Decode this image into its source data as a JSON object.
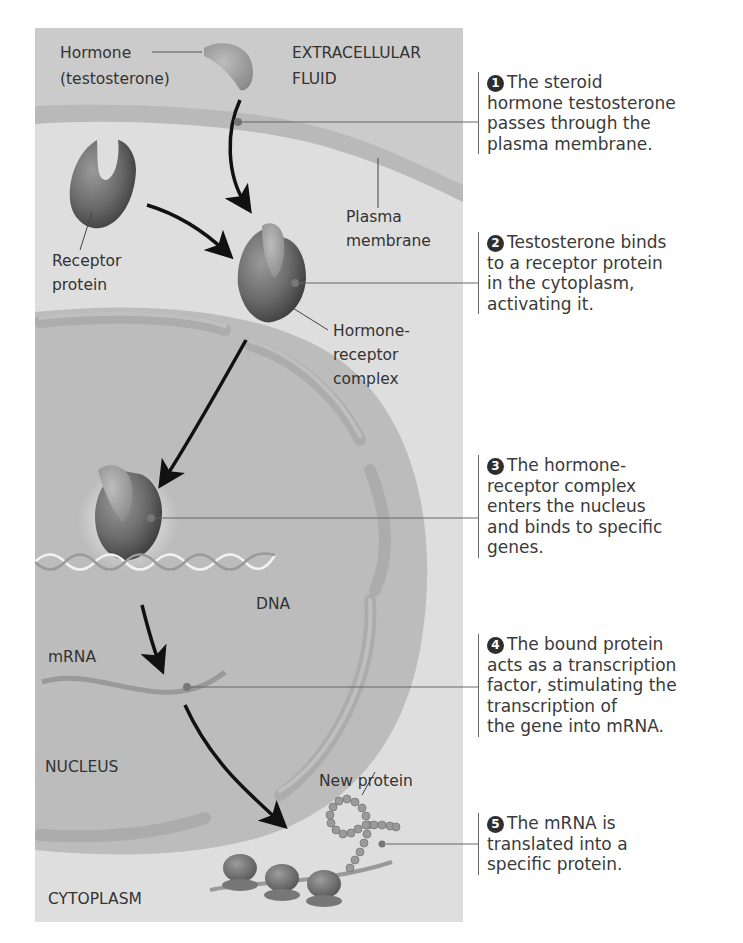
{
  "diagram": {
    "colors": {
      "extracellular": "#c9c9c9",
      "cytoplasm": "#dedede",
      "membrane": "#b8b8b8",
      "nucleus": "#bdbdbd",
      "nuclear_envelope": "#b0b0b0",
      "protein": "#6a6a6a",
      "hormone": "#9a9a9a",
      "arrow": "#111111",
      "leader_line": "#666666"
    },
    "labels": {
      "hormone": "Hormone",
      "hormone_sub": "(testosterone)",
      "extracellular_1": "EXTRACELLULAR",
      "extracellular_2": "FLUID",
      "plasma_1": "Plasma",
      "plasma_2": "membrane",
      "receptor_1": "Receptor",
      "receptor_2": "protein",
      "complex_1": "Hormone-",
      "complex_2": "receptor",
      "complex_3": "complex",
      "dna": "DNA",
      "mrna": "mRNA",
      "nucleus": "NUCLEUS",
      "new_protein": "New protein",
      "cytoplasm": "CYTOPLASM"
    },
    "steps": [
      {
        "number": "1",
        "text": "The steroid\nhormone testosterone\npasses through the\nplasma membrane."
      },
      {
        "number": "2",
        "text": "Testosterone binds\nto a receptor protein\nin the cytoplasm,\nactivating it."
      },
      {
        "number": "3",
        "text": "The hormone-\nreceptor complex\nenters the nucleus\nand binds to specific\ngenes."
      },
      {
        "number": "4",
        "text": "The bound protein\nacts as a transcription\nfactor, stimulating the\ntranscription of\nthe gene into mRNA."
      },
      {
        "number": "5",
        "text": "The mRNA is\ntranslated into a\nspecific protein."
      }
    ]
  }
}
